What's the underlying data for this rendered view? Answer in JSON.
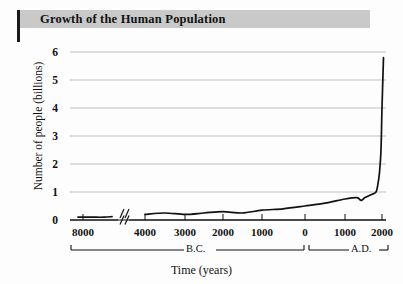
{
  "figure": {
    "title": "Growth of the Human Population",
    "title_band_color": "#c9c9c9",
    "accent_rule_color": "#1a1a1a",
    "background_color": "#fdfdfd"
  },
  "chart_data": {
    "type": "line",
    "title": "Growth of the Human Population",
    "subtitle": "",
    "xlabel": "Time (years)",
    "ylabel": "Number of people (billions)",
    "ylim": [
      0,
      6
    ],
    "ytick_values": [
      0,
      1,
      2,
      3,
      4,
      5,
      6
    ],
    "ytick_labels": [
      "0",
      "1",
      "2",
      "3",
      "4",
      "5",
      "6"
    ],
    "grid": "horizontal",
    "legend": "none",
    "axis_break": {
      "present": true,
      "between_labels": [
        "8000",
        "4000"
      ],
      "note": "double-slash break in x axis and data line"
    },
    "xtick_labels": [
      "8000",
      "4000",
      "3000",
      "2000",
      "1000",
      "0",
      "1000",
      "2000"
    ],
    "xtick_eras": [
      "B.C.",
      "B.C.",
      "B.C.",
      "B.C.",
      "B.C.",
      "0",
      "A.D.",
      "A.D."
    ],
    "era_brackets": [
      {
        "label": "B.C."
      },
      {
        "label": "A.D."
      }
    ],
    "line_color": "#111111",
    "grid_color": "#b8b8b8",
    "series": [
      {
        "name": "World population",
        "points": [
          {
            "year_label": "8000 B.C.",
            "value": 0.1
          },
          {
            "year_label": "7000 B.C.",
            "value": 0.1
          },
          {
            "year_label": "6000 B.C.",
            "value": 0.1
          },
          {
            "year_label": "5000 B.C.",
            "value": 0.12
          },
          {
            "year_label": "4000 B.C.",
            "value": 0.2
          },
          {
            "year_label": "3500 B.C.",
            "value": 0.25
          },
          {
            "year_label": "3000 B.C.",
            "value": 0.2
          },
          {
            "year_label": "2500 B.C.",
            "value": 0.25
          },
          {
            "year_label": "2000 B.C.",
            "value": 0.3
          },
          {
            "year_label": "1500 B.C.",
            "value": 0.25
          },
          {
            "year_label": "1000 B.C.",
            "value": 0.35
          },
          {
            "year_label": "500 B.C.",
            "value": 0.4
          },
          {
            "year_label": "0",
            "value": 0.5
          },
          {
            "year_label": "500 A.D.",
            "value": 0.6
          },
          {
            "year_label": "1000 A.D.",
            "value": 0.75
          },
          {
            "year_label": "1300 A.D.",
            "value": 0.8
          },
          {
            "year_label": "1400 A.D.",
            "value": 0.7
          },
          {
            "year_label": "1500 A.D.",
            "value": 0.8
          },
          {
            "year_label": "1650 A.D.",
            "value": 0.9
          },
          {
            "year_label": "1800 A.D.",
            "value": 1.0
          },
          {
            "year_label": "1850 A.D.",
            "value": 1.3
          },
          {
            "year_label": "1900 A.D.",
            "value": 1.7
          },
          {
            "year_label": "1950 A.D.",
            "value": 2.5
          },
          {
            "year_label": "1975 A.D.",
            "value": 4.0
          },
          {
            "year_label": "2000 A.D.",
            "value": 5.8
          }
        ]
      }
    ]
  }
}
